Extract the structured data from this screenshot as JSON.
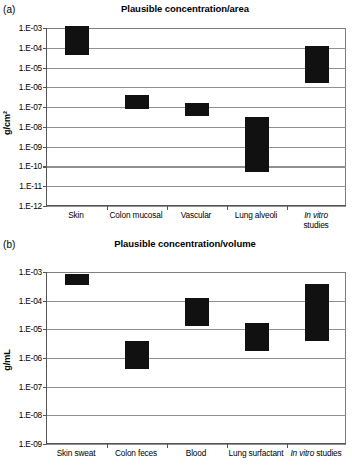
{
  "figure": {
    "panels": [
      {
        "panel_label": "(a)",
        "title": "Plausible concentration/area",
        "ylabel": "g/cm²"
      },
      {
        "panel_label": "(b)",
        "title": "Plausible concentration/volume",
        "ylabel": "g/mL"
      }
    ]
  },
  "chart_data": [
    {
      "type": "bar",
      "title": "Plausible concentration/area",
      "panel": "(a)",
      "xlabel": "",
      "ylabel": "g/cm²",
      "yscale": "log",
      "ylim": [
        1e-12,
        0.001
      ],
      "ytick_labels": [
        "1.E-03",
        "1.E-04",
        "1.E-05",
        "1.E-06",
        "1.E-07",
        "1.E-08",
        "1.E-09",
        "1.E-10",
        "1.E-11",
        "1.E-12"
      ],
      "ytick_values": [
        0.001,
        0.0001,
        1e-05,
        1e-06,
        1e-07,
        1e-08,
        1e-09,
        1e-10,
        1e-11,
        1e-12
      ],
      "grid": true,
      "legend": false,
      "categories": [
        "Skin",
        "Colon mucosal",
        "Vascular",
        "Lung alveoli",
        "In vitro studies"
      ],
      "category_lines": [
        [
          "Skin"
        ],
        [
          "Colon mucosal"
        ],
        [
          "Vascular"
        ],
        [
          "Lung alveoli"
        ],
        [
          "In vitro",
          "studies"
        ]
      ],
      "ranges": [
        {
          "category": "Skin",
          "high": 0.0013,
          "low": 4.5e-05
        },
        {
          "category": "Colon mucosal",
          "high": 4e-07,
          "low": 8e-08
        },
        {
          "category": "Vascular",
          "high": 1.7e-07,
          "low": 3.5e-08
        },
        {
          "category": "Lung alveoli",
          "high": 3e-08,
          "low": 5.5e-11
        },
        {
          "category": "In vitro studies",
          "high": 0.00013,
          "low": 1.7e-06
        }
      ]
    },
    {
      "type": "bar",
      "title": "Plausible concentration/volume",
      "panel": "(b)",
      "xlabel": "",
      "ylabel": "g/mL",
      "yscale": "log",
      "ylim": [
        1e-09,
        0.001
      ],
      "ytick_labels": [
        "1.E-03",
        "1.E-04",
        "1.E-05",
        "1.E-06",
        "1.E-07",
        "1.E-08",
        "1.E-09"
      ],
      "ytick_values": [
        0.001,
        0.0001,
        1e-05,
        1e-06,
        1e-07,
        1e-08,
        1e-09
      ],
      "grid": true,
      "legend": false,
      "categories": [
        "Skin sweat",
        "Colon feces",
        "Blood",
        "Lung surfactant",
        "In vitro studies"
      ],
      "category_lines": [
        [
          "Skin sweat"
        ],
        [
          "Colon feces"
        ],
        [
          "Blood"
        ],
        [
          "Lung surfactant"
        ],
        [
          "In vitro studies"
        ]
      ],
      "ranges": [
        {
          "category": "Skin sweat",
          "high": 0.00085,
          "low": 0.00036
        },
        {
          "category": "Colon feces",
          "high": 3.8e-06,
          "low": 4.2e-07
        },
        {
          "category": "Blood",
          "high": 0.00012,
          "low": 1.3e-05
        },
        {
          "category": "Lung surfactant",
          "high": 1.6e-05,
          "low": 1.7e-06
        },
        {
          "category": "In vitro studies",
          "high": 0.00037,
          "low": 4e-06
        }
      ]
    }
  ]
}
